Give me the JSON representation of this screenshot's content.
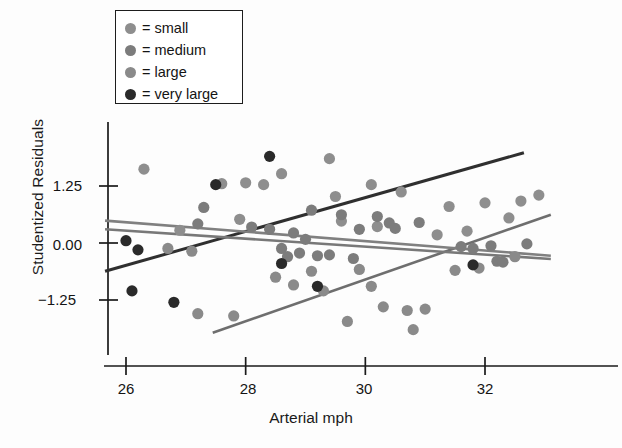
{
  "chart_data": {
    "type": "scatter",
    "title": "",
    "xlabel": "Arterial mph",
    "ylabel": "Studentized Residuals",
    "xlim": [
      25.6,
      33.2
    ],
    "ylim": [
      -2.05,
      2.15
    ],
    "xticks": [
      26,
      28,
      30,
      32
    ],
    "xtick_labels": [
      "26",
      "28",
      "30",
      "32"
    ],
    "yticks": [
      1.25,
      0.0,
      -1.25
    ],
    "ytick_labels": [
      "1.25",
      "0.00",
      "-1.25"
    ],
    "grid": false,
    "legend_position": "top-left",
    "legend_title": "",
    "series": [
      {
        "name": "small",
        "label": "= small",
        "color": "#8e8e8e",
        "marker": "circle",
        "points": [
          [
            26.3,
            1.62
          ],
          [
            27.6,
            1.3
          ],
          [
            28.0,
            1.32
          ],
          [
            28.3,
            1.28
          ],
          [
            28.6,
            1.52
          ],
          [
            29.4,
            1.85
          ],
          [
            29.5,
            1.02
          ],
          [
            30.1,
            1.28
          ],
          [
            30.6,
            1.12
          ],
          [
            31.4,
            0.8
          ],
          [
            32.0,
            0.88
          ],
          [
            32.6,
            0.92
          ],
          [
            32.9,
            1.05
          ],
          [
            26.9,
            0.28
          ],
          [
            27.9,
            0.52
          ],
          [
            29.6,
            0.48
          ],
          [
            30.2,
            0.36
          ],
          [
            31.2,
            0.18
          ],
          [
            31.7,
            0.26
          ],
          [
            32.4,
            0.55
          ]
        ]
      },
      {
        "name": "medium",
        "label": "= medium",
        "color": "#7c7c7c",
        "marker": "circle",
        "points": [
          [
            27.3,
            0.78
          ],
          [
            27.2,
            0.42
          ],
          [
            28.1,
            0.35
          ],
          [
            28.4,
            0.3
          ],
          [
            28.8,
            0.22
          ],
          [
            29.0,
            0.08
          ],
          [
            29.1,
            0.72
          ],
          [
            29.6,
            0.62
          ],
          [
            29.9,
            0.3
          ],
          [
            30.2,
            0.58
          ],
          [
            30.4,
            0.44
          ],
          [
            30.5,
            0.32
          ],
          [
            30.9,
            0.45
          ],
          [
            28.6,
            -0.12
          ],
          [
            28.7,
            -0.3
          ],
          [
            28.9,
            -0.22
          ],
          [
            29.2,
            -0.28
          ],
          [
            29.4,
            -0.26
          ],
          [
            29.8,
            -0.34
          ],
          [
            31.6,
            -0.08
          ],
          [
            31.8,
            -0.12
          ],
          [
            32.1,
            -0.06
          ],
          [
            32.2,
            -0.4
          ],
          [
            32.3,
            -0.42
          ],
          [
            32.7,
            -0.02
          ]
        ]
      },
      {
        "name": "large",
        "label": "= large",
        "color": "#8a8a8a",
        "marker": "circle",
        "points": [
          [
            26.7,
            -0.12
          ],
          [
            27.1,
            -0.18
          ],
          [
            28.5,
            -0.75
          ],
          [
            28.8,
            -0.92
          ],
          [
            29.1,
            -0.62
          ],
          [
            29.3,
            -1.05
          ],
          [
            27.2,
            -1.55
          ],
          [
            27.8,
            -1.6
          ],
          [
            29.7,
            -1.72
          ],
          [
            30.3,
            -1.4
          ],
          [
            30.7,
            -1.48
          ],
          [
            31.0,
            -1.45
          ],
          [
            30.8,
            -1.9
          ],
          [
            31.5,
            -0.6
          ],
          [
            31.9,
            -0.55
          ],
          [
            32.5,
            -0.3
          ],
          [
            29.9,
            -0.58
          ],
          [
            30.1,
            -0.95
          ]
        ]
      },
      {
        "name": "very large",
        "label": "= very large",
        "color": "#2a2a2a",
        "marker": "circle",
        "points": [
          [
            26.0,
            0.05
          ],
          [
            26.2,
            -0.15
          ],
          [
            26.1,
            -1.05
          ],
          [
            26.8,
            -1.3
          ],
          [
            27.5,
            1.28
          ],
          [
            28.4,
            1.9
          ],
          [
            28.6,
            -0.45
          ],
          [
            29.2,
            -0.95
          ],
          [
            31.8,
            -0.48
          ]
        ]
      }
    ],
    "trend_lines": [
      {
        "name": "very-large-trend",
        "color": "#2f2f2f",
        "width": 3.0,
        "x_start": 25.65,
        "y_start": -0.62,
        "x_end": 32.65,
        "y_end": 1.98
      },
      {
        "name": "large-trend",
        "color": "#6e6e6e",
        "width": 2.6,
        "x_start": 27.45,
        "y_start": -1.97,
        "x_end": 33.1,
        "y_end": 0.62
      },
      {
        "name": "small-trend",
        "color": "#808080",
        "width": 2.6,
        "x_start": 25.65,
        "y_start": 0.49,
        "x_end": 33.1,
        "y_end": -0.28
      },
      {
        "name": "medium-trend",
        "color": "#787878",
        "width": 2.6,
        "x_start": 25.65,
        "y_start": 0.3,
        "x_end": 33.1,
        "y_end": -0.35
      }
    ]
  },
  "axes": {
    "y_title": "Studentized Residuals",
    "x_title": "Arterial mph",
    "y_tick_labels": [
      "1.25",
      "0.00",
      "−1.25"
    ],
    "x_tick_labels": [
      "26",
      "28",
      "30",
      "32"
    ]
  },
  "legend": {
    "entries": [
      {
        "label": "= small",
        "color": "#8e8e8e"
      },
      {
        "label": "= medium",
        "color": "#7c7c7c"
      },
      {
        "label": "= large",
        "color": "#8a8a8a"
      },
      {
        "label": "= very large",
        "color": "#2a2a2a"
      }
    ]
  },
  "style": {
    "axis_color": "#1a1a1a",
    "background": "#fdfdfd",
    "marker_radius_px": 5.6
  }
}
